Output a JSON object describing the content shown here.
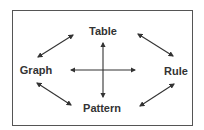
{
  "diagram": {
    "nodes": {
      "top": "Table",
      "left": "Graph",
      "right": "Rule",
      "bottom": "Pattern"
    },
    "edges": [
      {
        "from": "Graph",
        "to": "Table",
        "type": "bidirectional"
      },
      {
        "from": "Table",
        "to": "Rule",
        "type": "bidirectional"
      },
      {
        "from": "Graph",
        "to": "Pattern",
        "type": "bidirectional"
      },
      {
        "from": "Pattern",
        "to": "Rule",
        "type": "bidirectional"
      },
      {
        "from": "Table",
        "to": "Pattern",
        "type": "bidirectional",
        "note": "vertical center arrow"
      },
      {
        "from": "Graph",
        "to": "Rule",
        "type": "bidirectional",
        "note": "horizontal center arrow"
      }
    ],
    "colors": {
      "stroke": "#333333",
      "border": "#555555"
    }
  }
}
